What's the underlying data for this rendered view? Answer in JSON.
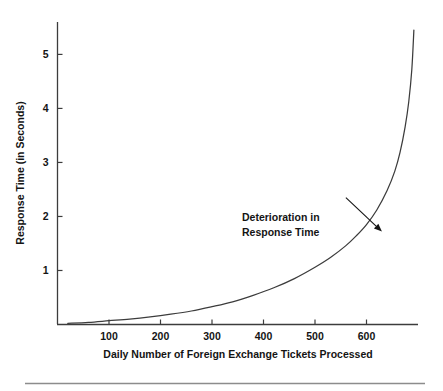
{
  "chart_data": {
    "type": "line",
    "title": "",
    "subtitle": "",
    "xlabel": "Daily Number of Foreign Exchange Tickets Processed",
    "ylabel": "Response Time (in Seconds)",
    "xlim": [
      0,
      700
    ],
    "ylim": [
      0,
      5.6
    ],
    "xticks": [
      100,
      200,
      300,
      400,
      500,
      600
    ],
    "xtick_labels": [
      "100",
      "200",
      "300",
      "400",
      "500",
      "600"
    ],
    "yticks": [
      1,
      2,
      3,
      4,
      5
    ],
    "ytick_labels": [
      "1",
      "2",
      "3",
      "4",
      "5"
    ],
    "grid": false,
    "legend": "none",
    "series": [
      {
        "name": "Response Time",
        "color": "#3c3c3c",
        "x": [
          20,
          60,
          100,
          140,
          180,
          220,
          260,
          300,
          340,
          380,
          420,
          460,
          500,
          530,
          560,
          580,
          600,
          620,
          640,
          655,
          665,
          675,
          682,
          688,
          692
        ],
        "y": [
          0.02,
          0.04,
          0.07,
          0.1,
          0.14,
          0.19,
          0.25,
          0.33,
          0.42,
          0.54,
          0.68,
          0.85,
          1.06,
          1.24,
          1.46,
          1.64,
          1.85,
          2.12,
          2.48,
          2.84,
          3.18,
          3.66,
          4.12,
          4.72,
          5.45
        ]
      }
    ],
    "annotations": [
      {
        "name": "deterioration-callout",
        "line1": "Deterioration in",
        "line2": "Response Time",
        "arrow_from_x": 560,
        "arrow_from_y": 2.35,
        "arrow_to_x": 630,
        "arrow_to_y": 1.72
      }
    ],
    "axis_color": "#3c3c3c",
    "text_color": "#141414",
    "background": "#ffffff",
    "footer_rule": true
  }
}
